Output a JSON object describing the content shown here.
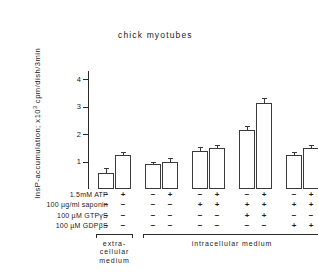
{
  "figure": {
    "title": "chick myotubes",
    "ylabel_main": "InsP-accumulation; x10",
    "ylabel_exp": "3",
    "ylabel_tail": " cpm/dish/3min"
  },
  "chart_data": {
    "type": "bar",
    "title": "chick myotubes",
    "xlabel": "",
    "ylabel": "InsP-accumulation; x10^3 cpm/dish/3min",
    "ylim": [
      0,
      4.3
    ],
    "yticks": [
      1,
      2,
      3,
      4
    ],
    "ytick_labels": [
      "1",
      "2",
      "3",
      "4"
    ],
    "grid": false,
    "legend": "none",
    "categories": [
      "1",
      "2",
      "3",
      "4",
      "5",
      "6",
      "7",
      "8",
      "9",
      "10"
    ],
    "values": [
      0.6,
      1.25,
      0.9,
      1.0,
      1.4,
      1.5,
      2.15,
      3.15,
      1.25,
      1.5
    ],
    "errors": [
      0.12,
      0.07,
      0.06,
      0.09,
      0.08,
      0.08,
      0.1,
      0.12,
      0.07,
      0.08
    ],
    "groups": [
      {
        "name": "extra-cellular medium",
        "bars": [
          0,
          1
        ]
      },
      {
        "name": "intracellular medium",
        "bars": [
          2,
          3,
          4,
          5,
          6,
          7,
          8,
          9
        ]
      }
    ],
    "conditions": {
      "rows": [
        {
          "label": "1.5mM ATP",
          "signs": [
            "−",
            "+",
            "−",
            "+",
            "−",
            "+",
            "−",
            "+",
            "−",
            "+"
          ]
        },
        {
          "label": "100 µg/ml saponin",
          "signs": [
            "−",
            "−",
            "−",
            "−",
            "+",
            "+",
            "+",
            "+",
            "+",
            "+"
          ]
        },
        {
          "label": "100 µM GTPγS",
          "signs": [
            "−",
            "−",
            "−",
            "−",
            "−",
            "−",
            "+",
            "+",
            "−",
            "−"
          ]
        },
        {
          "label": "100 µM GDPβS",
          "signs": [
            "−",
            "−",
            "−",
            "−",
            "−",
            "−",
            "−",
            "−",
            "+",
            "+"
          ]
        }
      ]
    },
    "bracket_labels": {
      "extracellular": "extra-\ncellular\nmedium",
      "intracellular": "intracellular medium"
    },
    "colors": {
      "bar_fill": "#ffffff",
      "bar_stroke": "#3a3a3a",
      "axis": "#2a2a2a",
      "text": "#1a1a1a"
    }
  }
}
